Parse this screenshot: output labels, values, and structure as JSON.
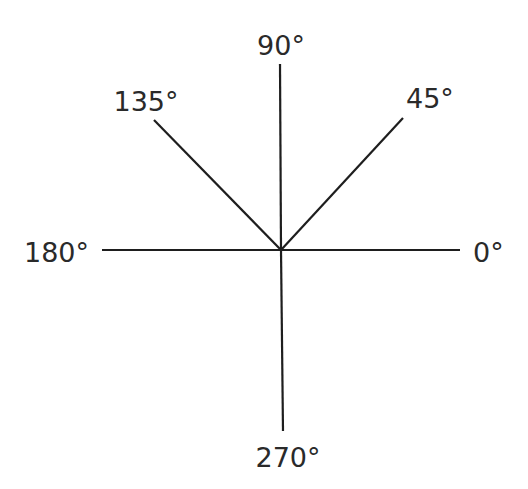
{
  "diagram": {
    "type": "angle-directions",
    "center": {
      "x": 281,
      "y": 250
    },
    "rays": [
      {
        "angle": 0,
        "label": "0°",
        "end": {
          "x": 460,
          "y": 250
        },
        "label_pos": {
          "x": 473,
          "y": 262,
          "anchor": "start"
        }
      },
      {
        "angle": 45,
        "label": "45°",
        "end": {
          "x": 403,
          "y": 118
        },
        "label_pos": {
          "x": 406,
          "y": 108,
          "anchor": "start"
        }
      },
      {
        "angle": 90,
        "label": "90°",
        "end": {
          "x": 280,
          "y": 64
        },
        "label_pos": {
          "x": 281,
          "y": 55,
          "anchor": "middle"
        }
      },
      {
        "angle": 135,
        "label": "135°",
        "end": {
          "x": 154,
          "y": 120
        },
        "label_pos": {
          "x": 146,
          "y": 111,
          "anchor": "middle"
        }
      },
      {
        "angle": 180,
        "label": "180°",
        "end": {
          "x": 102,
          "y": 250
        },
        "label_pos": {
          "x": 89,
          "y": 262,
          "anchor": "end"
        }
      },
      {
        "angle": 270,
        "label": "270°",
        "end": {
          "x": 283,
          "y": 431
        },
        "label_pos": {
          "x": 288,
          "y": 467,
          "anchor": "middle"
        }
      }
    ],
    "line_color": "#1e1e1e",
    "text_color": "#2a2a2a",
    "background": "#ffffff"
  }
}
